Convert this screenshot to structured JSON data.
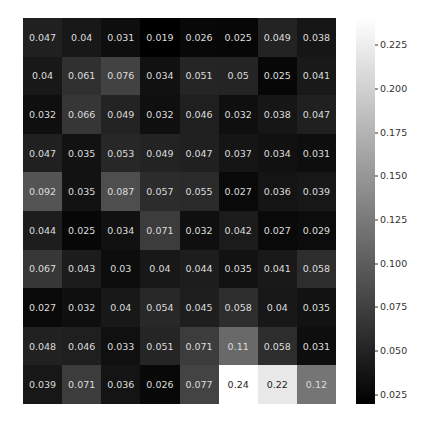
{
  "chart_data": {
    "type": "heatmap",
    "title": "",
    "xlabel": "",
    "ylabel": "",
    "rows": 10,
    "cols": 8,
    "values": [
      [
        0.047,
        0.04,
        0.031,
        0.019,
        0.026,
        0.025,
        0.049,
        0.038
      ],
      [
        0.04,
        0.061,
        0.076,
        0.034,
        0.051,
        0.05,
        0.025,
        0.041
      ],
      [
        0.032,
        0.066,
        0.049,
        0.032,
        0.046,
        0.032,
        0.038,
        0.047
      ],
      [
        0.047,
        0.035,
        0.053,
        0.049,
        0.047,
        0.037,
        0.034,
        0.031
      ],
      [
        0.092,
        0.035,
        0.087,
        0.057,
        0.055,
        0.027,
        0.036,
        0.039
      ],
      [
        0.044,
        0.025,
        0.034,
        0.071,
        0.032,
        0.042,
        0.027,
        0.029
      ],
      [
        0.067,
        0.043,
        0.03,
        0.04,
        0.044,
        0.035,
        0.041,
        0.058
      ],
      [
        0.027,
        0.032,
        0.04,
        0.054,
        0.045,
        0.058,
        0.04,
        0.035
      ],
      [
        0.048,
        0.046,
        0.033,
        0.051,
        0.071,
        0.11,
        0.058,
        0.031
      ],
      [
        0.039,
        0.071,
        0.036,
        0.026,
        0.077,
        0.24,
        0.22,
        0.12
      ]
    ],
    "labels": [
      [
        "0.047",
        "0.04",
        "0.031",
        "0.019",
        "0.026",
        "0.025",
        "0.049",
        "0.038"
      ],
      [
        "0.04",
        "0.061",
        "0.076",
        "0.034",
        "0.051",
        "0.05",
        "0.025",
        "0.041"
      ],
      [
        "0.032",
        "0.066",
        "0.049",
        "0.032",
        "0.046",
        "0.032",
        "0.038",
        "0.047"
      ],
      [
        "0.047",
        "0.035",
        "0.053",
        "0.049",
        "0.047",
        "0.037",
        "0.034",
        "0.031"
      ],
      [
        "0.092",
        "0.035",
        "0.087",
        "0.057",
        "0.055",
        "0.027",
        "0.036",
        "0.039"
      ],
      [
        "0.044",
        "0.025",
        "0.034",
        "0.071",
        "0.032",
        "0.042",
        "0.027",
        "0.029"
      ],
      [
        "0.067",
        "0.043",
        "0.03",
        "0.04",
        "0.044",
        "0.035",
        "0.041",
        "0.058"
      ],
      [
        "0.027",
        "0.032",
        "0.04",
        "0.054",
        "0.045",
        "0.058",
        "0.04",
        "0.035"
      ],
      [
        "0.048",
        "0.046",
        "0.033",
        "0.051",
        "0.071",
        "0.11",
        "0.058",
        "0.031"
      ],
      [
        "0.039",
        "0.071",
        "0.036",
        "0.026",
        "0.077",
        "0.24",
        "0.22",
        "0.12"
      ]
    ],
    "colormap": "gray",
    "vmin": 0.019,
    "vmax": 0.24,
    "colorbar_ticks": [
      "0.225",
      "0.200",
      "0.175",
      "0.150",
      "0.125",
      "0.100",
      "0.075",
      "0.050",
      "0.025"
    ],
    "colorbar_tick_values": [
      0.225,
      0.2,
      0.175,
      0.15,
      0.125,
      0.1,
      0.075,
      0.05,
      0.025
    ],
    "annotated": true,
    "grid": false
  }
}
